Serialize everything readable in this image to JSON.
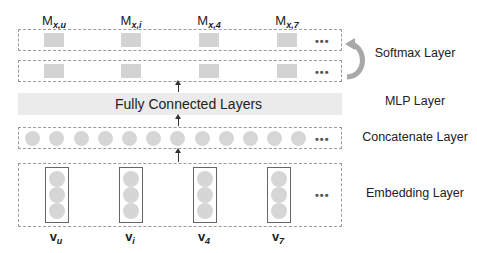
{
  "diagram": {
    "type": "neural-network-architecture",
    "softmax_outputs": [
      {
        "base": "M",
        "sub": "x,u"
      },
      {
        "base": "M",
        "sub": "x,i"
      },
      {
        "base": "M",
        "sub": "x,4"
      },
      {
        "base": "M",
        "sub": "x,7"
      }
    ],
    "ellipsis": "•••",
    "mlp_text": "Fully Connected Layers",
    "inputs": [
      {
        "base": "v",
        "sub": "u"
      },
      {
        "base": "v",
        "sub": "i"
      },
      {
        "base": "v",
        "sub": "4"
      },
      {
        "base": "v",
        "sub": "7"
      }
    ],
    "concatenate_units": 12,
    "embedding_units_per_vector": 3,
    "layers": {
      "softmax": "Softmax Layer",
      "mlp": "MLP Layer",
      "concatenate": "Concatenate Layer",
      "embedding": "Embedding Layer"
    },
    "colors": {
      "unit_fill": "#d6d6d6",
      "mlp_band": "#ebebeb",
      "dashed_border": "#9a9a9a",
      "softmax_arrow": "#a8a8a8"
    }
  }
}
